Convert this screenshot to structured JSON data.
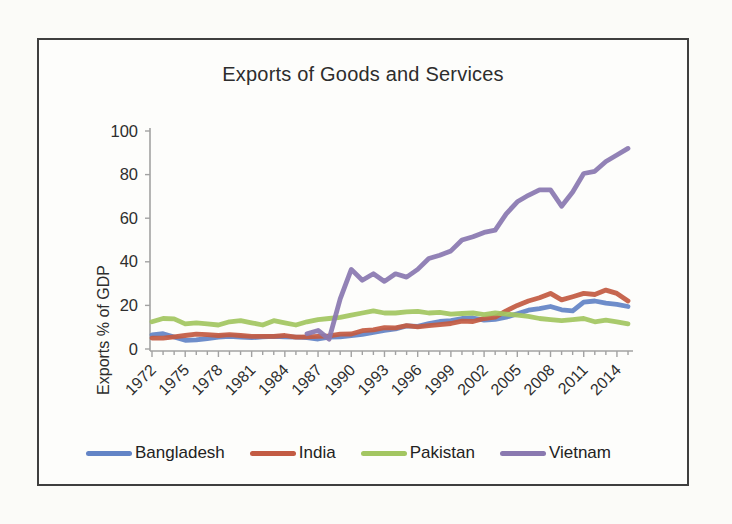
{
  "page": {
    "background": "#fbfbf8",
    "frame_border_color": "#3f3f3f"
  },
  "chart_data": {
    "type": "line",
    "title": "Exports of Goods and Services",
    "xlabel": "",
    "ylabel": "Exports % of GDP",
    "ylim": [
      0,
      100
    ],
    "y_ticks": [
      0,
      20,
      40,
      60,
      80,
      100
    ],
    "x_start_year": 1972,
    "x_end_year": 2015,
    "x_tick_label_years": [
      1972,
      1975,
      1978,
      1981,
      1984,
      1987,
      1990,
      1993,
      1996,
      1999,
      2002,
      2005,
      2008,
      2011,
      2014
    ],
    "grid": false,
    "legend_position": "bottom",
    "axis_color": "#a2a2a2",
    "text_color": "#2e2e2e",
    "series": [
      {
        "name": "Bangladesh",
        "color": "#6384c6",
        "values": [
          6.5,
          7.0,
          5.5,
          4.0,
          4.2,
          4.8,
          5.5,
          5.8,
          5.5,
          5.2,
          5.6,
          5.8,
          5.6,
          5.4,
          5.2,
          4.6,
          5.4,
          5.6,
          6.1,
          6.7,
          7.6,
          8.6,
          9.2,
          10.6,
          10.4,
          11.6,
          12.6,
          13.0,
          14.0,
          14.2,
          13.2,
          13.6,
          14.6,
          16.2,
          17.8,
          18.5,
          19.5,
          18.0,
          17.5,
          21.5,
          22.0,
          21.0,
          20.5,
          19.5
        ]
      },
      {
        "name": "India",
        "color": "#c35b43",
        "values": [
          5.0,
          5.0,
          5.6,
          6.2,
          6.8,
          6.6,
          6.2,
          6.6,
          6.2,
          5.8,
          5.8,
          5.8,
          6.2,
          5.4,
          5.6,
          5.8,
          6.0,
          6.8,
          6.9,
          8.4,
          8.8,
          9.8,
          9.7,
          10.7,
          10.2,
          10.7,
          11.2,
          11.7,
          12.8,
          12.6,
          14.0,
          14.6,
          17.5,
          20.0,
          22.0,
          23.5,
          25.5,
          22.5,
          24.0,
          25.5,
          25.0,
          27.0,
          25.5,
          22.0
        ]
      },
      {
        "name": "Pakistan",
        "color": "#a3c661",
        "values": [
          12.5,
          14.0,
          13.8,
          11.5,
          12.0,
          11.5,
          11.0,
          12.5,
          13.0,
          12.0,
          11.0,
          13.0,
          12.0,
          11.0,
          12.5,
          13.5,
          14.0,
          14.5,
          15.5,
          16.5,
          17.5,
          16.5,
          16.5,
          17.0,
          17.3,
          16.5,
          16.8,
          16.0,
          16.3,
          16.5,
          15.8,
          16.5,
          16.0,
          15.5,
          15.0,
          14.0,
          13.5,
          13.0,
          13.5,
          14.0,
          12.5,
          13.2,
          12.5,
          11.5
        ]
      },
      {
        "name": "Vietnam",
        "color": "#8a79b0",
        "values": [
          null,
          null,
          null,
          null,
          null,
          null,
          null,
          null,
          null,
          null,
          null,
          null,
          null,
          null,
          7.0,
          8.5,
          4.5,
          23.0,
          36.5,
          31.5,
          34.5,
          31.0,
          34.5,
          33.0,
          36.5,
          41.5,
          43.0,
          45.0,
          50.0,
          51.5,
          53.5,
          54.5,
          62.0,
          67.5,
          70.5,
          73.0,
          73.0,
          65.5,
          72.0,
          80.5,
          81.5,
          86.0,
          89.0,
          92.0
        ]
      }
    ]
  }
}
